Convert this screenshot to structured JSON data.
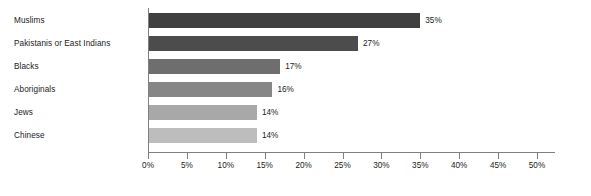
{
  "chart_data": {
    "type": "bar",
    "orientation": "horizontal",
    "title": "",
    "xlabel": "",
    "ylabel": "",
    "xlim": [
      0,
      50
    ],
    "xtick_step": 5,
    "grid": false,
    "legend": "none",
    "categories": [
      "Muslims",
      "Pakistanis or East Indians",
      "Blacks",
      "Aboriginals",
      "Jews",
      "Chinese"
    ],
    "values": [
      35,
      27,
      17,
      16,
      14,
      14
    ],
    "value_labels": [
      "35%",
      "27%",
      "17%",
      "16%",
      "14%",
      "14%"
    ],
    "bar_colors": [
      "#3f3f3f",
      "#4c4c4c",
      "#6e6e6e",
      "#868686",
      "#a8a8a8",
      "#bdbdbd"
    ],
    "xticks": [
      0,
      5,
      10,
      15,
      20,
      25,
      30,
      35,
      40,
      45,
      50
    ],
    "xtick_labels": [
      "0%",
      "5%",
      "10%",
      "15%",
      "20%",
      "25%",
      "30%",
      "35%",
      "40%",
      "45%",
      "50%"
    ],
    "axis_color": "#808080",
    "text_color": "#1a1a1a",
    "background": "#ffffff"
  }
}
